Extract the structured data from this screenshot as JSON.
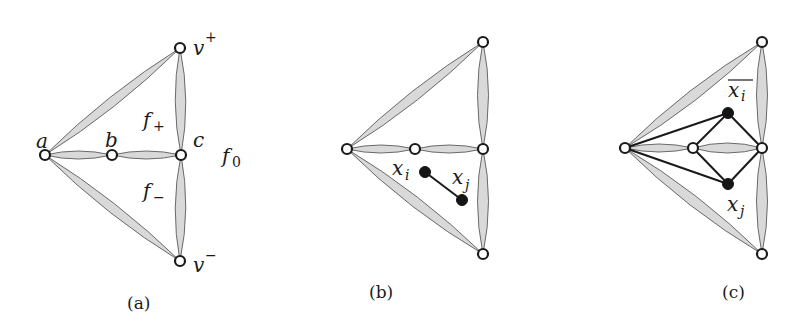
{
  "figure": {
    "panels": [
      {
        "id": "a",
        "caption": "(a)",
        "vertex_labels": {
          "a": "a",
          "b": "b",
          "c": "c",
          "v_plus": "v",
          "v_plus_sup": "+",
          "v_minus": "v",
          "v_minus_sup": "−"
        },
        "face_labels": {
          "f_plus": "f",
          "f_plus_sub": "+",
          "f_minus": "f",
          "f_minus_sub": "−",
          "f_zero": "f",
          "f_zero_sub": "0"
        }
      },
      {
        "id": "b",
        "caption": "(b)",
        "vertex_labels": {
          "x_i": "x",
          "x_i_sub": "i",
          "x_j": "x",
          "x_j_sub": "j"
        }
      },
      {
        "id": "c",
        "caption": "(c)",
        "vertex_labels": {
          "x_i_bar": "x",
          "x_i_bar_sub": "i",
          "x_j": "x",
          "x_j_sub": "j"
        }
      }
    ],
    "colors": {
      "lens_fill": "#d9d9d9",
      "lens_stroke": "#6a6a6a",
      "node_stroke": "#1a1a1a",
      "filled_node": "#151515"
    }
  }
}
